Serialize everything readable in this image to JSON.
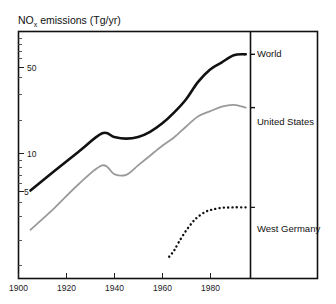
{
  "chart_data": {
    "type": "line",
    "title": "NO",
    "title_sub": "x",
    "title_rest": " emissions  (Tg/yr)",
    "ylabel": "NOx emissions (Tg/yr)",
    "xlabel": "",
    "yscale": "log",
    "ylim": [
      1.4,
      110
    ],
    "xlim": [
      1895,
      1992
    ],
    "grid": false,
    "legend_position": "right-panel",
    "ytick_labels": [
      "50",
      "10",
      "5"
    ],
    "ytick_values": [
      50,
      10,
      5
    ],
    "ytick_minor_values": [
      2,
      3,
      4,
      6,
      7,
      8,
      9,
      20,
      30,
      40,
      60,
      70,
      80,
      90,
      100
    ],
    "xtick_labels": [
      "1900",
      "1920",
      "1940",
      "1960",
      "1980"
    ],
    "xtick_values": [
      1900,
      1920,
      1940,
      1960,
      1980
    ],
    "series": [
      {
        "name": "World",
        "color": "#111111",
        "style": "solid",
        "width": 2.6,
        "x": [
          1900,
          1910,
          1920,
          1930,
          1935,
          1940,
          1945,
          1950,
          1955,
          1960,
          1965,
          1970,
          1975,
          1980,
          1985,
          1990
        ],
        "values": [
          5.0,
          7.2,
          10.3,
          14.6,
          13.6,
          13.2,
          13.6,
          15.0,
          17.5,
          21.5,
          27.5,
          38.0,
          48.0,
          55.0,
          63.0,
          64.0
        ]
      },
      {
        "name": "United States",
        "color": "#9a9a9a",
        "style": "solid",
        "width": 1.8,
        "x": [
          1900,
          1910,
          1920,
          1930,
          1935,
          1940,
          1945,
          1950,
          1955,
          1960,
          1965,
          1970,
          1975,
          1980,
          1985,
          1990
        ],
        "values": [
          2.4,
          3.6,
          5.6,
          8.0,
          6.8,
          6.7,
          8.0,
          9.6,
          11.5,
          13.5,
          16.5,
          20.0,
          22.0,
          24.0,
          24.8,
          23.6
        ]
      },
      {
        "name": "West Germany",
        "color": "#111111",
        "style": "dotted",
        "width": 2.4,
        "x": [
          1958,
          1960,
          1962,
          1965,
          1968,
          1970,
          1973,
          1976,
          1980,
          1985,
          1990
        ],
        "values": [
          1.45,
          1.62,
          1.9,
          2.35,
          2.8,
          3.05,
          3.35,
          3.5,
          3.62,
          3.65,
          3.65
        ]
      }
    ],
    "legend_entries": [
      {
        "label": "World",
        "y_value": 64.0
      },
      {
        "label": "United States",
        "y_value": 23.6
      },
      {
        "label": "West Germany",
        "y_value": 3.65
      }
    ]
  }
}
